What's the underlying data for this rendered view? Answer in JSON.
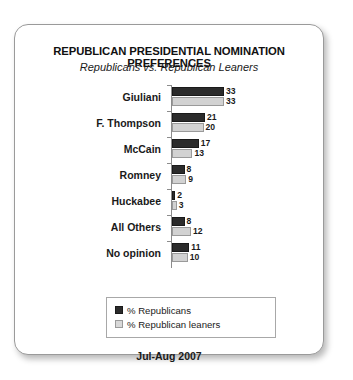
{
  "chart_data": {
    "type": "bar",
    "orientation": "horizontal",
    "title": "REPUBLICAN PRESIDENTIAL NOMINATION PREFERENCES",
    "subtitle": "Republicans vs. Republican Leaners",
    "footer": "Jul-Aug 2007",
    "xlabel": "",
    "ylabel": "",
    "xlim": [
      0,
      35
    ],
    "grid": false,
    "legend_position": "bottom",
    "categories": [
      "Giuliani",
      "F. Thompson",
      "McCain",
      "Romney",
      "Huckabee",
      "All Others",
      "No opinion"
    ],
    "series": [
      {
        "name": "% Republicans",
        "color": "#2b2b2b",
        "values": [
          33,
          21,
          17,
          8,
          2,
          8,
          11
        ]
      },
      {
        "name": "% Republican leaners",
        "color": "#d2d2d2",
        "values": [
          33,
          20,
          13,
          9,
          3,
          12,
          10
        ]
      }
    ]
  },
  "legend": {
    "items": [
      {
        "label": "% Republicans"
      },
      {
        "label": "% Republican leaners"
      }
    ]
  }
}
